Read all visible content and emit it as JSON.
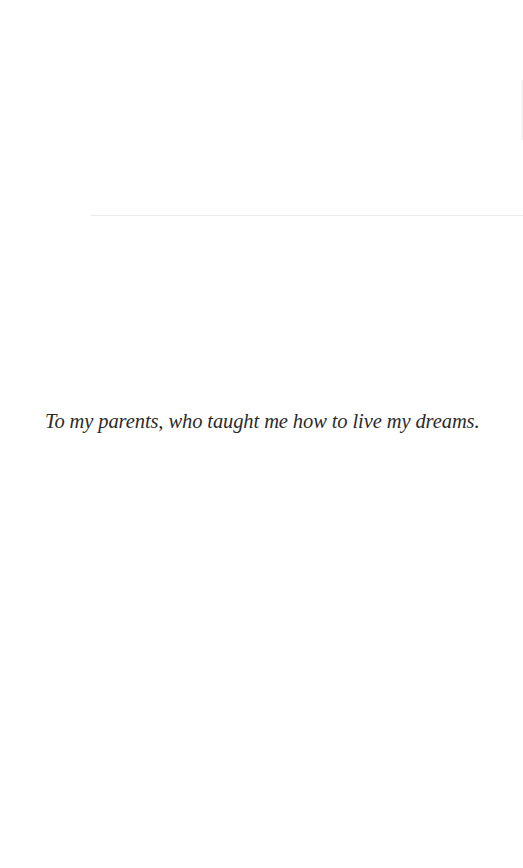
{
  "page": {
    "dedication": "To my parents, who taught me how to live my dreams."
  }
}
